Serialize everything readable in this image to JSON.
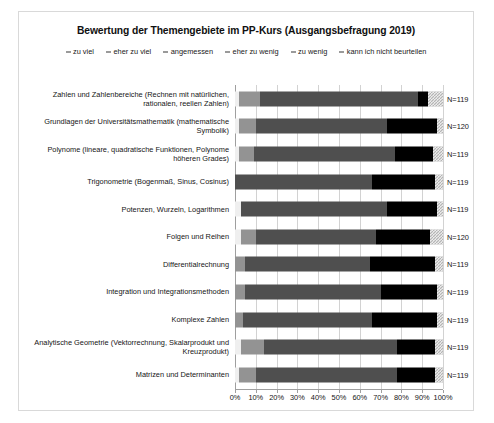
{
  "chart_data": {
    "type": "bar",
    "orientation": "horizontal",
    "stacked": true,
    "normalized_percent": true,
    "title": "Bewertung der Themengebiete im PP-Kurs (Ausgangsbefragung 2019)",
    "xlabel": "",
    "ylabel": "",
    "xlim": [
      0,
      100
    ],
    "grid": true,
    "legend_position": "top",
    "xticklabels": [
      "0%",
      "10%",
      "20%",
      "30%",
      "40%",
      "50%",
      "60%",
      "70%",
      "80%",
      "90%",
      "100%"
    ],
    "xticks": [
      0,
      10,
      20,
      30,
      40,
      50,
      60,
      70,
      80,
      90,
      100
    ],
    "series": [
      {
        "name": "zu viel",
        "color": "#efefef",
        "values": [
          2,
          2,
          2,
          0,
          3,
          3,
          0,
          0,
          0,
          3,
          2
        ]
      },
      {
        "name": "eher zu viel",
        "color": "#939393",
        "values": [
          10,
          8,
          7,
          0,
          0,
          7,
          5,
          5,
          4,
          11,
          8
        ]
      },
      {
        "name": "angemessen",
        "color": "#4f4f4f",
        "values": [
          76,
          63,
          68,
          66,
          70,
          58,
          60,
          65,
          62,
          64,
          68
        ]
      },
      {
        "name": "eher zu wenig",
        "color": "#262626",
        "values": [
          0,
          0,
          0,
          0,
          0,
          0,
          0,
          0,
          0,
          0,
          0
        ]
      },
      {
        "name": "zu wenig",
        "color": "#000000",
        "values": [
          5,
          24,
          18,
          30,
          24,
          26,
          31,
          27,
          31,
          18,
          18
        ]
      },
      {
        "name": "kann ich nicht beurteilen",
        "color": "#b5b5b5",
        "values": [
          7,
          3,
          5,
          4,
          3,
          6,
          4,
          3,
          3,
          4,
          4
        ]
      }
    ],
    "categories": [
      "Zahlen und Zahlenbereiche (Rechnen mit natürlichen, rationalen, reellen Zahlen)",
      "Grundlagen der Universitätsmathematik (mathematische Symbolik)",
      "Polynome (lineare, quadratische Funktionen, Polynome höheren Grades)",
      "Trigonometrie (Bogenmaß, Sinus, Cosinus)",
      "Potenzen, Wurzeln, Logarithmen",
      "Folgen und Reihen",
      "Differentialrechnung",
      "Integration und Integrationsmethoden",
      "Komplexe Zahlen",
      "Analytische Geometrie (Vektorrechnung, Skalarprodukt und Kreuzprodukt)",
      "Matrizen und Determinanten"
    ],
    "n_labels": [
      "N=119",
      "N=120",
      "N=119",
      "N=119",
      "N=119",
      "N=120",
      "N=119",
      "N=119",
      "N=119",
      "N=119",
      "N=119"
    ]
  },
  "legend": {
    "items": [
      {
        "label": "zu viel"
      },
      {
        "label": "eher zu viel"
      },
      {
        "label": "angemessen"
      },
      {
        "label": "eher zu wenig"
      },
      {
        "label": "zu wenig"
      },
      {
        "label": "kann ich nicht beurteilen"
      }
    ]
  }
}
